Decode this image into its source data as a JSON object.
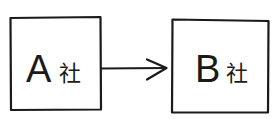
{
  "diagram": {
    "nodes": [
      {
        "id": "A",
        "letter": "A",
        "suffix": "社"
      },
      {
        "id": "B",
        "letter": "B",
        "suffix": "社"
      }
    ],
    "edges": [
      {
        "from": "A",
        "to": "B",
        "style": "arrow"
      }
    ],
    "colors": {
      "ink": "#1a1a1a",
      "background": "#ffffff"
    }
  }
}
